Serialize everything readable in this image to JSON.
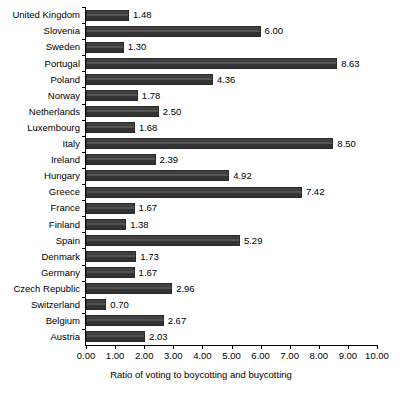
{
  "chart_data": {
    "type": "bar",
    "orientation": "horizontal",
    "title": "",
    "xlabel": "Ratio of voting to boycotting and buycotting",
    "ylabel": "",
    "xlim": [
      0.0,
      10.0
    ],
    "xticks": [
      "0.00",
      "1.00",
      "2.00",
      "3.00",
      "4.00",
      "5.00",
      "6.00",
      "7.00",
      "8.00",
      "9.00",
      "10.00"
    ],
    "grid": false,
    "legend": null,
    "value_label_format": "0.00",
    "bar_color": "#3f3f3f",
    "categories": [
      "United Kingdom",
      "Slovenia",
      "Sweden",
      "Portugal",
      "Poland",
      "Norway",
      "Netherlands",
      "Luxembourg",
      "Italy",
      "Ireland",
      "Hungary",
      "Greece",
      "France",
      "Finland",
      "Spain",
      "Denmark",
      "Germany",
      "Czech Republic",
      "Switzerland",
      "Belgium",
      "Austria"
    ],
    "values": [
      1.48,
      6.0,
      1.3,
      8.63,
      4.36,
      1.78,
      2.5,
      1.68,
      8.5,
      2.39,
      4.92,
      7.42,
      1.67,
      1.38,
      5.29,
      1.73,
      1.67,
      2.96,
      0.7,
      2.67,
      2.03
    ],
    "value_labels": [
      "1.48",
      "6.00",
      "1.30",
      "8.63",
      "4.36",
      "1.78",
      "2.50",
      "1.68",
      "8.50",
      "2.39",
      "4.92",
      "7.42",
      "1.67",
      "1.38",
      "5.29",
      "1.73",
      "1.67",
      "2.96",
      "0.70",
      "2.67",
      "2.03"
    ]
  }
}
